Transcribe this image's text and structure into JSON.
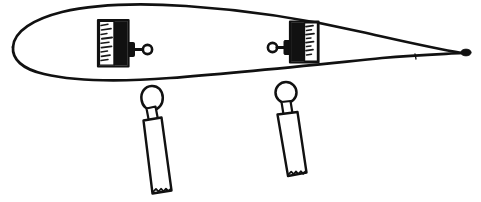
{
  "image": {
    "title": "Hand-drawn hull profile with two mounted blocks and two pendant tools",
    "medium": "scanned black ink line drawing on white paper",
    "width_px": 481,
    "height_px": 202,
    "background_color": "#ffffff",
    "ink_color": "#111111"
  },
  "figure": {
    "caption": "",
    "label": ""
  },
  "parts": {
    "hull": {
      "name": "hull-outline",
      "description": "Long asymmetric lens / airfoil shape, blunt rounded nose at left, tapering to a sharp point at right",
      "nose_end": "left",
      "tip_end": "right",
      "tip_marker": "small dark blob at right point",
      "stroke_width": 2.6
    },
    "block_left": {
      "name": "left-block",
      "description": "Upright rectangular block mounted inside the hull; hatched light panel on its left side, solid black panel on its right side",
      "light_panel_side": "left",
      "dark_panel_side": "right",
      "hatch_marks": 9,
      "knob_side": "right",
      "knob_description": "collar flange, short rod, small open ring"
    },
    "block_right": {
      "name": "right-block",
      "description": "Upright rectangular block mounted inside the hull, mirrored: solid black panel on its left side, hatched light panel on its right side",
      "light_panel_side": "right",
      "dark_panel_side": "left",
      "hatch_marks": 8,
      "knob_side": "left",
      "knob_description": "small open ring, short rod, collar flange"
    },
    "pendant_left": {
      "name": "left-pendant-tool",
      "description": "Hanging tool below the hull: teardrop/egg shaped head, narrow neck, long tapering rectangular body with a jagged torn bottom edge",
      "head_shape": "teardrop",
      "bottom_edge": "jagged"
    },
    "pendant_right": {
      "name": "right-pendant-tool",
      "description": "Hanging tool below the hull: round head, narrow neck, long tapering rectangular body with a jagged torn bottom edge",
      "head_shape": "circle",
      "bottom_edge": "jagged"
    }
  }
}
